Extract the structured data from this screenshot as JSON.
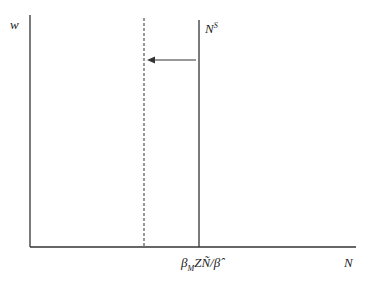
{
  "diagram": {
    "type": "labor-supply-shift",
    "y_axis_label": "w",
    "x_axis_label": "N",
    "supply_curve": {
      "label_base": "N",
      "label_sup": "S",
      "x_value_label": "β_M Z N̄ / β̂"
    },
    "x_tick": {
      "b": "β",
      "sub": "M",
      "rest": "ZÑ/",
      "hat": "β̂"
    },
    "dashed_line": "new supply (shifted left)",
    "arrow": "leftward shift",
    "colors": {
      "line": "#333333",
      "background": "#ffffff"
    }
  }
}
